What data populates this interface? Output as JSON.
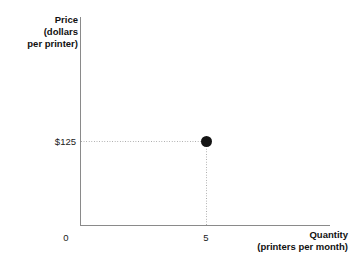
{
  "chart_data": {
    "type": "scatter",
    "title": "",
    "xlabel": "Quantity",
    "xlabel_lines": [
      "Quantity",
      "(printers per month)"
    ],
    "ylabel": "Price",
    "ylabel_lines": [
      "Price",
      "(dollars",
      "per printer)"
    ],
    "x_tick_labels": [
      "0",
      "5"
    ],
    "y_tick_labels": [
      "$125"
    ],
    "x_tick_values": [
      0,
      5
    ],
    "y_tick_values": [
      125
    ],
    "xlim": [
      0,
      10
    ],
    "ylim": [
      0,
      250
    ],
    "grid": false,
    "legend": null,
    "points": [
      {
        "label": "equilibrium-point",
        "x": 5,
        "y": 125,
        "x_display": "5",
        "y_display": "$125",
        "marker": "filled-circle",
        "color": "#141414"
      }
    ],
    "guide_lines": [
      {
        "orientation": "horizontal",
        "value": 125,
        "style": "dotted",
        "color": "#a8a8a8"
      },
      {
        "orientation": "vertical",
        "value": 5,
        "style": "dotted",
        "color": "#a8a8a8"
      }
    ],
    "axis_color": "#8a8a8a"
  },
  "axes": {
    "y_title": {
      "line1": "Price",
      "line2": "(dollars",
      "line3": "per printer)"
    },
    "x_title": {
      "line1": "Quantity",
      "line2": "(printers per month)"
    },
    "y_ticks": {
      "t125": "$125"
    },
    "x_ticks": {
      "t0": "0",
      "t5": "5"
    }
  }
}
